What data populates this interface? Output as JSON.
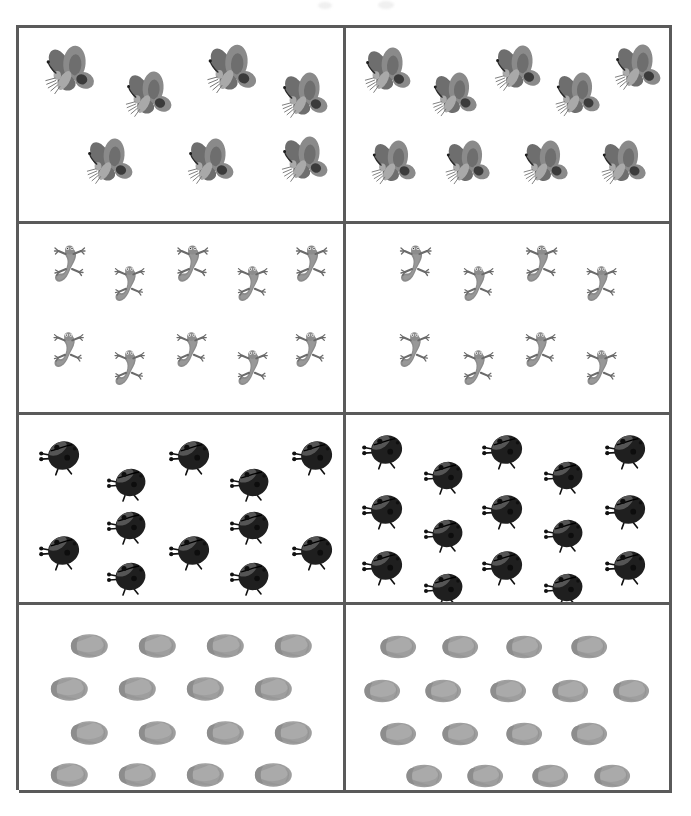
{
  "page": {
    "background_color": "#ffffff",
    "border_color": "#5a5a5a",
    "width": 691,
    "height": 816
  },
  "grid": {
    "rows": 4,
    "columns": 2,
    "left": 16,
    "top": 25,
    "width": 656,
    "height": 765,
    "border_width_px": 3
  },
  "scan_marks": [
    {
      "name": "mark-a",
      "x": 318,
      "y": 2
    },
    {
      "name": "mark-b",
      "x": 378,
      "y": 1
    }
  ],
  "chart_data": {
    "type": "table",
    "xlabel": "",
    "ylabel": "",
    "categories": [
      "Butterflies",
      "Lizards",
      "Ladybugs",
      "Fish"
    ],
    "series": [
      {
        "name": "Left panel",
        "values": [
          7,
          10,
          12,
          16
        ]
      },
      {
        "name": "Right panel",
        "values": [
          9,
          8,
          15,
          17
        ]
      }
    ],
    "legend_position": "none",
    "grid": true
  },
  "rows": [
    {
      "name": "butterflies",
      "icon": "butterfly-icon",
      "label": "Butterflies",
      "left": {
        "count": 7,
        "items": [
          {
            "x": 6,
            "y": 8,
            "size": 62,
            "rot": -4
          },
          {
            "x": 31,
            "y": 21,
            "size": 58,
            "rot": -4
          },
          {
            "x": 56,
            "y": 7,
            "size": 62,
            "rot": -4
          },
          {
            "x": 79,
            "y": 22,
            "size": 58,
            "rot": -4
          },
          {
            "x": 19,
            "y": 56,
            "size": 58,
            "rot": -4
          },
          {
            "x": 50,
            "y": 56,
            "size": 58,
            "rot": -4
          },
          {
            "x": 79,
            "y": 55,
            "size": 58,
            "rot": -4
          }
        ]
      },
      "right": {
        "count": 9,
        "items": [
          {
            "x": 4,
            "y": 9,
            "size": 58,
            "rot": -4
          },
          {
            "x": 25,
            "y": 22,
            "size": 56,
            "rot": -4
          },
          {
            "x": 44,
            "y": 8,
            "size": 58,
            "rot": -4
          },
          {
            "x": 63,
            "y": 22,
            "size": 56,
            "rot": -4
          },
          {
            "x": 81,
            "y": 7,
            "size": 58,
            "rot": -4
          },
          {
            "x": 6,
            "y": 57,
            "size": 56,
            "rot": -4
          },
          {
            "x": 29,
            "y": 57,
            "size": 56,
            "rot": -4
          },
          {
            "x": 53,
            "y": 57,
            "size": 56,
            "rot": -4
          },
          {
            "x": 77,
            "y": 57,
            "size": 56,
            "rot": -4
          }
        ]
      }
    },
    {
      "name": "lizards",
      "icon": "lizard-icon",
      "label": "Lizards",
      "left": {
        "count": 10,
        "items": [
          {
            "x": 7,
            "y": 8,
            "size": 50,
            "rot": 0
          },
          {
            "x": 26,
            "y": 19,
            "size": 48,
            "rot": 0
          },
          {
            "x": 45,
            "y": 8,
            "size": 50,
            "rot": 0
          },
          {
            "x": 64,
            "y": 19,
            "size": 48,
            "rot": 0
          },
          {
            "x": 82,
            "y": 8,
            "size": 50,
            "rot": 0
          },
          {
            "x": 7,
            "y": 54,
            "size": 48,
            "rot": 0
          },
          {
            "x": 26,
            "y": 64,
            "size": 48,
            "rot": 0
          },
          {
            "x": 45,
            "y": 54,
            "size": 48,
            "rot": 0
          },
          {
            "x": 64,
            "y": 64,
            "size": 48,
            "rot": 0
          },
          {
            "x": 82,
            "y": 54,
            "size": 48,
            "rot": 0
          }
        ]
      },
      "right": {
        "count": 8,
        "items": [
          {
            "x": 13,
            "y": 8,
            "size": 50,
            "rot": 0
          },
          {
            "x": 33,
            "y": 19,
            "size": 48,
            "rot": 0
          },
          {
            "x": 52,
            "y": 8,
            "size": 50,
            "rot": 0
          },
          {
            "x": 71,
            "y": 19,
            "size": 48,
            "rot": 0
          },
          {
            "x": 13,
            "y": 54,
            "size": 48,
            "rot": 0
          },
          {
            "x": 33,
            "y": 64,
            "size": 48,
            "rot": 0
          },
          {
            "x": 52,
            "y": 54,
            "size": 48,
            "rot": 0
          },
          {
            "x": 71,
            "y": 64,
            "size": 48,
            "rot": 0
          }
        ]
      }
    },
    {
      "name": "ladybugs",
      "icon": "ladybug-icon",
      "label": "Ladybugs",
      "left": {
        "count": 12,
        "items": [
          {
            "x": 5,
            "y": 7,
            "size": 52,
            "rot": 0
          },
          {
            "x": 26,
            "y": 22,
            "size": 50,
            "rot": 0
          },
          {
            "x": 45,
            "y": 7,
            "size": 52,
            "rot": 0
          },
          {
            "x": 64,
            "y": 22,
            "size": 50,
            "rot": 0
          },
          {
            "x": 83,
            "y": 7,
            "size": 52,
            "rot": 0
          },
          {
            "x": 26,
            "y": 45,
            "size": 50,
            "rot": 0
          },
          {
            "x": 64,
            "y": 45,
            "size": 50,
            "rot": 0
          },
          {
            "x": 5,
            "y": 58,
            "size": 52,
            "rot": 0
          },
          {
            "x": 45,
            "y": 58,
            "size": 52,
            "rot": 0
          },
          {
            "x": 83,
            "y": 58,
            "size": 52,
            "rot": 0
          },
          {
            "x": 26,
            "y": 72,
            "size": 50,
            "rot": 0
          },
          {
            "x": 64,
            "y": 72,
            "size": 50,
            "rot": 0
          }
        ]
      },
      "right": {
        "count": 15,
        "items": [
          {
            "x": 4,
            "y": 4,
            "size": 52,
            "rot": 0
          },
          {
            "x": 23,
            "y": 18,
            "size": 50,
            "rot": 0
          },
          {
            "x": 41,
            "y": 4,
            "size": 52,
            "rot": 0
          },
          {
            "x": 60,
            "y": 18,
            "size": 50,
            "rot": 0
          },
          {
            "x": 79,
            "y": 4,
            "size": 52,
            "rot": 0
          },
          {
            "x": 4,
            "y": 36,
            "size": 52,
            "rot": 0
          },
          {
            "x": 23,
            "y": 49,
            "size": 50,
            "rot": 0
          },
          {
            "x": 41,
            "y": 36,
            "size": 52,
            "rot": 0
          },
          {
            "x": 60,
            "y": 49,
            "size": 50,
            "rot": 0
          },
          {
            "x": 79,
            "y": 36,
            "size": 52,
            "rot": 0
          },
          {
            "x": 4,
            "y": 66,
            "size": 52,
            "rot": 0
          },
          {
            "x": 23,
            "y": 78,
            "size": 50,
            "rot": 0
          },
          {
            "x": 41,
            "y": 66,
            "size": 52,
            "rot": 0
          },
          {
            "x": 60,
            "y": 78,
            "size": 50,
            "rot": 0
          },
          {
            "x": 79,
            "y": 66,
            "size": 52,
            "rot": 0
          }
        ]
      }
    },
    {
      "name": "fish",
      "icon": "fish-icon",
      "label": "Fish",
      "left": {
        "count": 16,
        "items": [
          {
            "x": 12,
            "y": 7,
            "size": 56,
            "rot": 0
          },
          {
            "x": 33,
            "y": 7,
            "size": 56,
            "rot": 0
          },
          {
            "x": 54,
            "y": 7,
            "size": 56,
            "rot": 0
          },
          {
            "x": 75,
            "y": 7,
            "size": 56,
            "rot": 0
          },
          {
            "x": 6,
            "y": 30,
            "size": 56,
            "rot": 0
          },
          {
            "x": 27,
            "y": 30,
            "size": 56,
            "rot": 0
          },
          {
            "x": 48,
            "y": 30,
            "size": 56,
            "rot": 0
          },
          {
            "x": 69,
            "y": 30,
            "size": 56,
            "rot": 0
          },
          {
            "x": 12,
            "y": 54,
            "size": 56,
            "rot": 0
          },
          {
            "x": 33,
            "y": 54,
            "size": 56,
            "rot": 0
          },
          {
            "x": 54,
            "y": 54,
            "size": 56,
            "rot": 0
          },
          {
            "x": 75,
            "y": 54,
            "size": 56,
            "rot": 0
          },
          {
            "x": 6,
            "y": 77,
            "size": 56,
            "rot": 0
          },
          {
            "x": 27,
            "y": 77,
            "size": 56,
            "rot": 0
          },
          {
            "x": 48,
            "y": 77,
            "size": 56,
            "rot": 0
          },
          {
            "x": 69,
            "y": 77,
            "size": 56,
            "rot": 0
          }
        ]
      },
      "right": {
        "count": 17,
        "items": [
          {
            "x": 7,
            "y": 8,
            "size": 54,
            "rot": 0
          },
          {
            "x": 26,
            "y": 8,
            "size": 54,
            "rot": 0
          },
          {
            "x": 46,
            "y": 8,
            "size": 54,
            "rot": 0
          },
          {
            "x": 66,
            "y": 8,
            "size": 54,
            "rot": 0
          },
          {
            "x": 2,
            "y": 32,
            "size": 54,
            "rot": 0
          },
          {
            "x": 21,
            "y": 32,
            "size": 54,
            "rot": 0
          },
          {
            "x": 41,
            "y": 32,
            "size": 54,
            "rot": 0
          },
          {
            "x": 60,
            "y": 32,
            "size": 54,
            "rot": 0
          },
          {
            "x": 79,
            "y": 32,
            "size": 54,
            "rot": 0
          },
          {
            "x": 7,
            "y": 55,
            "size": 54,
            "rot": 0
          },
          {
            "x": 26,
            "y": 55,
            "size": 54,
            "rot": 0
          },
          {
            "x": 46,
            "y": 55,
            "size": 54,
            "rot": 0
          },
          {
            "x": 66,
            "y": 55,
            "size": 54,
            "rot": 0
          },
          {
            "x": 15,
            "y": 78,
            "size": 54,
            "rot": 0
          },
          {
            "x": 34,
            "y": 78,
            "size": 54,
            "rot": 0
          },
          {
            "x": 54,
            "y": 78,
            "size": 54,
            "rot": 0
          },
          {
            "x": 73,
            "y": 78,
            "size": 54,
            "rot": 0
          }
        ]
      }
    }
  ],
  "icons": {
    "butterfly-icon": {
      "fill_dark": "#6e6e6e",
      "fill_mid": "#8a8a8a",
      "fill_light": "#a9a9a9"
    },
    "lizard-icon": {
      "fill_dark": "#6a6a6a",
      "fill_mid": "#8c8c8c",
      "fill_light": "#a6a6a6"
    },
    "ladybug-icon": {
      "fill_dark": "#1f1f1f",
      "fill_mid": "#3a3a3a",
      "fill_light": "#555555"
    },
    "fish-icon": {
      "fill_dark": "#8d8d8d",
      "fill_mid": "#9e9e9e",
      "fill_light": "#b4b4b4"
    }
  }
}
